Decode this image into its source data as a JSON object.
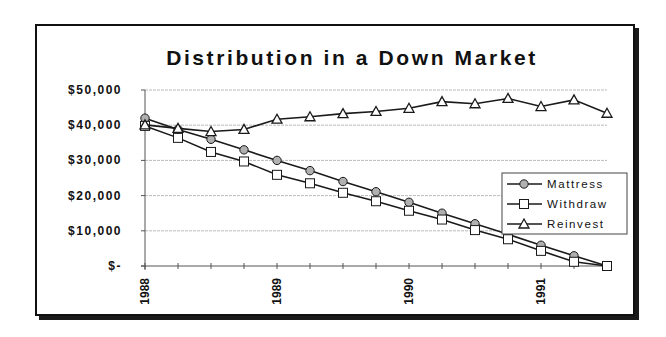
{
  "chart_data": {
    "type": "line",
    "title": "Distribution in a Down Market",
    "xlabel": "",
    "ylabel": "",
    "ylim": [
      0,
      50000
    ],
    "y_ticks": [
      "$50,000",
      "$40,000",
      "$30,000",
      "$20,000",
      "$10,000",
      "$-"
    ],
    "y_tick_values": [
      50000,
      40000,
      30000,
      20000,
      10000,
      0
    ],
    "x_tick_labels": [
      "1988",
      "1989",
      "1990",
      "1991"
    ],
    "x_tick_label_indices": [
      0,
      4,
      8,
      12
    ],
    "x": [
      0,
      1,
      2,
      3,
      4,
      5,
      6,
      7,
      8,
      9,
      10,
      11,
      12,
      13,
      14
    ],
    "grid": "horizontal",
    "legend_position": "right-inside",
    "series": [
      {
        "name": "Mattress",
        "marker": "circle",
        "values": [
          42000,
          38800,
          36000,
          33000,
          30000,
          27100,
          24000,
          21100,
          18100,
          15000,
          12000,
          9000,
          5900,
          2900,
          0
        ]
      },
      {
        "name": "Withdraw",
        "marker": "square",
        "values": [
          39800,
          36400,
          32400,
          29700,
          25900,
          23500,
          20800,
          18400,
          15700,
          13200,
          10200,
          7600,
          4300,
          1200,
          0
        ]
      },
      {
        "name": "Reinvest",
        "marker": "triangle",
        "values": [
          40100,
          39100,
          38200,
          38800,
          41700,
          42400,
          43300,
          43900,
          44800,
          46700,
          46100,
          47600,
          45300,
          47200,
          43400
        ]
      }
    ]
  },
  "colors": {
    "line": "#1a1a1a",
    "circle_fill": "#b0b0b0",
    "square_fill": "#ffffff",
    "triangle_fill": "#ffffff",
    "grid": "#a8a8a8"
  }
}
